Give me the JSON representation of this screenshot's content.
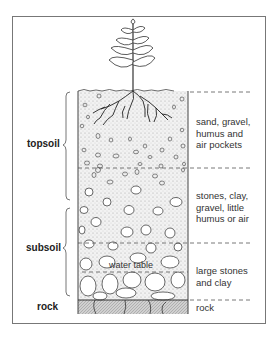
{
  "diagram": {
    "type": "soil-profile-cross-section",
    "layers": [
      {
        "name": "topsoil",
        "label": "topsoil",
        "description": "sand, gravel, humus and air pockets"
      },
      {
        "name": "topsoil-lower",
        "description": "stones, clay, gravel, little humus or air"
      },
      {
        "name": "subsoil",
        "label": "subsoil",
        "description": "large stones and clay"
      },
      {
        "name": "rock",
        "label": "rock",
        "description": "rock"
      }
    ],
    "annotations": {
      "water_table": "water table"
    },
    "left_labels": {
      "topsoil": "topsoil",
      "subsoil": "subsoil",
      "rock": "rock"
    },
    "right_labels": {
      "layer1_line1": "sand, gravel,",
      "layer1_line2": "humus and",
      "layer1_line3": "air pockets",
      "layer2_line1": "stones, clay,",
      "layer2_line2": "gravel, little",
      "layer2_line3": "humus or air",
      "layer3_line1": "large stones",
      "layer3_line2": "and clay",
      "layer4_line1": "rock"
    }
  }
}
